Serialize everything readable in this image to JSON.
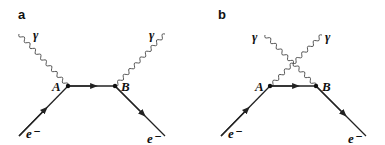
{
  "figure": {
    "panels": [
      {
        "label": "a",
        "description": "Compton scattering s-channel Feynman diagram",
        "vertices": [
          {
            "name": "A"
          },
          {
            "name": "B"
          }
        ],
        "photon_labels": [
          "γ",
          "γ"
        ],
        "electron_labels": [
          "e⁻",
          "e⁻"
        ]
      },
      {
        "label": "b",
        "description": "Compton scattering u-channel (crossed) Feynman diagram",
        "vertices": [
          {
            "name": "A"
          },
          {
            "name": "B"
          }
        ],
        "photon_labels": [
          "γ",
          "γ"
        ],
        "electron_labels": [
          "e⁻",
          "e⁻"
        ]
      }
    ]
  }
}
